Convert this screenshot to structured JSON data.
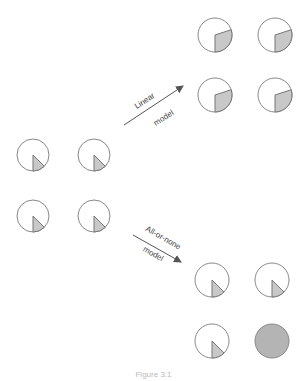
{
  "diagram": {
    "colors": {
      "outline": "#888888",
      "fill": "#c8c8c8",
      "full_fill": "#b4b4b4",
      "arrow": "#555555",
      "text": "#444444"
    },
    "initial_group": {
      "label": "initial state",
      "circles": [
        {
          "cx": 33,
          "cy": 155,
          "r": 16,
          "fraction": 0.125
        },
        {
          "cx": 94,
          "cy": 155,
          "r": 16,
          "fraction": 0.125
        },
        {
          "cx": 33,
          "cy": 216,
          "r": 16,
          "fraction": 0.125
        },
        {
          "cx": 94,
          "cy": 216,
          "r": 16,
          "fraction": 0.125
        }
      ]
    },
    "linear_model": {
      "label_line1": "Linear",
      "label_line2": "model",
      "circles": [
        {
          "cx": 215,
          "cy": 35,
          "r": 17,
          "fraction": 0.3
        },
        {
          "cx": 275,
          "cy": 35,
          "r": 17,
          "fraction": 0.3
        },
        {
          "cx": 215,
          "cy": 95,
          "r": 17,
          "fraction": 0.3
        },
        {
          "cx": 275,
          "cy": 95,
          "r": 17,
          "fraction": 0.3
        }
      ]
    },
    "all_or_none_model": {
      "label_line1": "All-or-none",
      "label_line2": "model",
      "circles": [
        {
          "cx": 212,
          "cy": 280,
          "r": 17,
          "fraction": 0.125
        },
        {
          "cx": 272,
          "cy": 280,
          "r": 17,
          "fraction": 0.125
        },
        {
          "cx": 212,
          "cy": 341,
          "r": 17,
          "fraction": 0.125
        },
        {
          "cx": 272,
          "cy": 341,
          "r": 17,
          "fraction": 1.0
        }
      ]
    },
    "caption": "Figure 3.1"
  }
}
